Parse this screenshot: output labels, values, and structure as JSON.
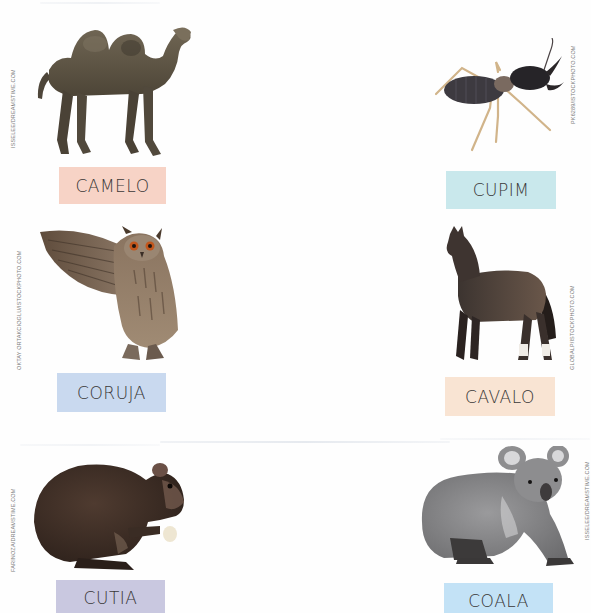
{
  "page": {
    "background": "#fefefe"
  },
  "cards": [
    {
      "id": "camelo",
      "label": "CAMELO",
      "label_bg": "#f7d3c6",
      "credit": "ISSELEE/DREAMSTIME.COM",
      "image": "camel-photo"
    },
    {
      "id": "cupim",
      "label": "CUPIM",
      "label_bg": "#c9e8ec",
      "credit": "PK6289/ISTOCKPHOTO.COM",
      "image": "termite-photo"
    },
    {
      "id": "coruja",
      "label": "CORUJA",
      "label_bg": "#c9d9ef",
      "credit": "OKTAY ORTAKCIOGLU/ISTOCKPHOTO.COM",
      "image": "owl-photo"
    },
    {
      "id": "cavalo",
      "label": "CAVALO",
      "label_bg": "#f9e4d3",
      "credit": "GLOBALP/ISTOCKPHOTO.COM",
      "image": "horse-photo"
    },
    {
      "id": "cutia",
      "label": "CUTIA",
      "label_bg": "#c9c8e0",
      "credit": "FARINOZA/DREAMSTIME.COM",
      "image": "agouti-photo"
    },
    {
      "id": "coala",
      "label": "COALA",
      "label_bg": "#c3e2f6",
      "credit": "ISSELEE/DREAMSTIME.COM",
      "image": "koala-photo"
    }
  ]
}
